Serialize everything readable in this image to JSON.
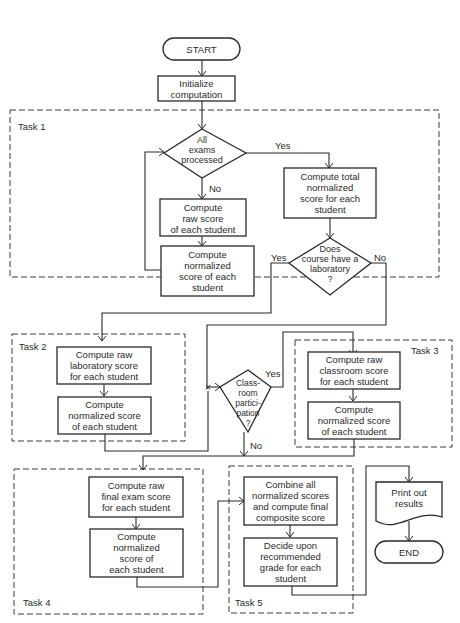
{
  "diagram": {
    "type": "flowchart",
    "terminals": {
      "start": "START",
      "end": "END"
    },
    "init": "Initialize\ncomputation",
    "task1": {
      "label": "Task 1",
      "decision_all_exams": "All\nexams\nprocessed",
      "yes": "Yes",
      "no": "No",
      "raw_score": "Compute\nraw score\nof each student",
      "normalized_score": "Compute\nnormalized\nscore of each\nstudent",
      "total_normalized": "Compute total\nnormalized\nscore for each\nstudent",
      "decision_lab": "Does\ncourse have a\nlaboratory\n?",
      "lab_yes": "Yes",
      "lab_no": "No"
    },
    "task2": {
      "label": "Task 2",
      "raw_lab": "Compute raw\nlaboratory score\nfor each student",
      "normalized": "Compute\nnormalized score\nof each student"
    },
    "classroom_decision": {
      "text": "Class-\nroom\npartici-\npation\n?",
      "yes": "Yes",
      "no": "No"
    },
    "task3": {
      "label": "Task 3",
      "raw_classroom": "Compute raw\nclassroom score\nfor each student",
      "normalized": "Compute\nnormalized score\nof each student"
    },
    "task4": {
      "label": "Task 4",
      "raw_final": "Compute raw\nfinal exam score\nfor each student",
      "normalized": "Compute\nnormalized\nscore of\neach student"
    },
    "task5": {
      "label": "Task 5",
      "combine": "Combine all\nnormalized scores\nand compute final\ncomposite score",
      "decide": "Decide upon\nrecommended\ngrade for each\nstudent"
    },
    "output": "Print out\nresults"
  },
  "colors": {
    "line": "#2a2a2a",
    "background": "#ffffff"
  }
}
